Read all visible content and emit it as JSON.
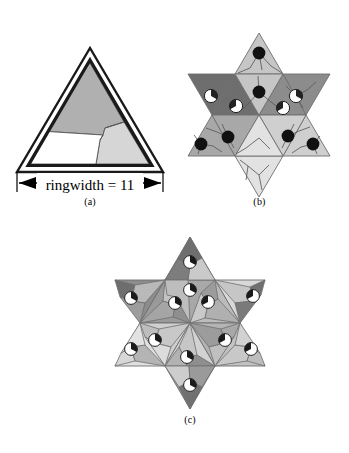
{
  "figure": {
    "background": "#ffffff",
    "ink": "#000000",
    "panels": [
      {
        "id": "a",
        "caption": "(a)"
      },
      {
        "id": "b",
        "caption": "(b)"
      },
      {
        "id": "c",
        "caption": "(c)"
      }
    ]
  },
  "panel_a": {
    "caption": "(a)",
    "dimension_label": "ringwidth = 11",
    "ring_value": 11,
    "outer_triangle": {
      "stroke": "#1a1a1a",
      "fill": "#ffffff",
      "stroke_width": 2
    },
    "inner_triangle": {
      "stroke": "#1a1a1a",
      "fill": "#ffffff",
      "stroke_width": 4
    },
    "regions": [
      {
        "name": "top-region",
        "fill": "#b0b0b0",
        "shade": "dark-gray"
      },
      {
        "name": "right-region",
        "fill": "#d6d6d6",
        "shade": "light-gray"
      },
      {
        "name": "bottom-left-region",
        "fill": "#ffffff",
        "shade": "white"
      }
    ],
    "subdivision_stroke": "#555555"
  },
  "panel_b": {
    "caption": "(b)",
    "shape": "hexagram",
    "triangle_count": 12,
    "cell_stroke": "#6e6e6e",
    "triangles": [
      {
        "index": 0,
        "position": "point-top",
        "orientation": "up",
        "fill": "#c6c6c6"
      },
      {
        "index": 1,
        "position": "point-upper-right",
        "orientation": "down",
        "fill": "#8c8c8c"
      },
      {
        "index": 2,
        "position": "point-lower-right",
        "orientation": "up",
        "fill": "#cfcfcf"
      },
      {
        "index": 3,
        "position": "point-bottom",
        "orientation": "down",
        "fill": "#e2e2e2"
      },
      {
        "index": 4,
        "position": "point-lower-left",
        "orientation": "up",
        "fill": "#a8a8a8"
      },
      {
        "index": 5,
        "position": "point-upper-left",
        "orientation": "down",
        "fill": "#6e6e6e"
      },
      {
        "index": 6,
        "position": "core-upper-left",
        "orientation": "down",
        "fill": "#6e6e6e"
      },
      {
        "index": 7,
        "position": "core-upper-right",
        "orientation": "down",
        "fill": "#8c8c8c"
      },
      {
        "index": 8,
        "position": "core-top",
        "orientation": "up",
        "fill": "#c6c6c6"
      },
      {
        "index": 9,
        "position": "core-lower-left",
        "orientation": "up",
        "fill": "#a8a8a8"
      },
      {
        "index": 10,
        "position": "core-lower-right",
        "orientation": "up",
        "fill": "#cfcfcf"
      },
      {
        "index": 11,
        "position": "core-bottom",
        "orientation": "down",
        "fill": "#e2e2e2"
      }
    ],
    "markers": {
      "solid_dot": {
        "fill": "#111111",
        "stroke": "#111111",
        "count": 6
      },
      "pie_marker": {
        "fill": "#ffffff",
        "wedge_fill": "#222222",
        "stroke": "#222222",
        "count": 4
      }
    }
  },
  "panel_c": {
    "caption": "(c)",
    "shape": "hexagram",
    "triangle_count": 12,
    "cell_stroke": "#6e6e6e",
    "triangles": [
      {
        "index": 0,
        "position": "point-top",
        "orientation": "up",
        "fill": "#8c8c8c"
      },
      {
        "index": 1,
        "position": "point-upper-right",
        "orientation": "down",
        "fill": "#d8d8d8"
      },
      {
        "index": 2,
        "position": "point-lower-right",
        "orientation": "up",
        "fill": "#c2c2c2"
      },
      {
        "index": 3,
        "position": "point-bottom",
        "orientation": "down",
        "fill": "#9a9a9a"
      },
      {
        "index": 4,
        "position": "point-lower-left",
        "orientation": "up",
        "fill": "#e0e0e0"
      },
      {
        "index": 5,
        "position": "point-upper-left",
        "orientation": "down",
        "fill": "#8c8c8c"
      },
      {
        "index": 6,
        "position": "core-upper-left",
        "orientation": "down",
        "fill": "#9a9a9a"
      },
      {
        "index": 7,
        "position": "core-upper-right",
        "orientation": "down",
        "fill": "#bcbcbc"
      },
      {
        "index": 8,
        "position": "core-top",
        "orientation": "up",
        "fill": "#a8a8a8"
      },
      {
        "index": 9,
        "position": "core-lower-left",
        "orientation": "up",
        "fill": "#cfcfcf"
      },
      {
        "index": 10,
        "position": "core-lower-right",
        "orientation": "up",
        "fill": "#b4b4b4"
      },
      {
        "index": 11,
        "position": "core-bottom",
        "orientation": "down",
        "fill": "#d2d2d2"
      }
    ],
    "markers": {
      "solid_dot": {
        "fill": "#111111",
        "stroke": "#111111",
        "count": 12
      },
      "pie_marker": {
        "fill": "#ffffff",
        "wedge_fill": "#222222",
        "stroke": "#222222",
        "count": 12
      }
    }
  }
}
